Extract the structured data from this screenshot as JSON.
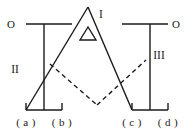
{
  "figure": {
    "type": "line-diagram",
    "width": 194,
    "height": 129,
    "background_color": "#ffffff",
    "stroke_color": "#1a1a1a"
  },
  "labels": {
    "origin_left": "O",
    "origin_right": "O",
    "region_one": "I",
    "region_two": "II",
    "region_three": "III",
    "delta_symbol": "Δ"
  },
  "axis_labels": {
    "a": "( a )",
    "b": "( b )",
    "c": "( c )",
    "d": "( d )"
  },
  "geometry": {
    "left_top_rule": {
      "x1": 26,
      "y1": 24,
      "x2": 72,
      "y2": 24
    },
    "right_top_rule": {
      "x1": 122,
      "y1": 24,
      "x2": 168,
      "y2": 24
    },
    "left_vertical": {
      "x1": 44,
      "y1": 24,
      "x2": 44,
      "y2": 110
    },
    "right_vertical": {
      "x1": 150,
      "y1": 24,
      "x2": 150,
      "y2": 110
    },
    "left_baseline": {
      "x1": 26,
      "y1": 110,
      "x2": 62,
      "y2": 110
    },
    "right_baseline": {
      "x1": 132,
      "y1": 110,
      "x2": 168,
      "y2": 110
    },
    "left_tick_outer": {
      "x1": 26,
      "y1": 104,
      "x2": 26,
      "y2": 110
    },
    "left_tick_inner": {
      "x1": 62,
      "y1": 104,
      "x2": 62,
      "y2": 110
    },
    "right_tick_inner": {
      "x1": 132,
      "y1": 104,
      "x2": 132,
      "y2": 110
    },
    "right_tick_outer": {
      "x1": 168,
      "y1": 104,
      "x2": 168,
      "y2": 110
    },
    "peak_left_edge": {
      "x1": 26,
      "y1": 110,
      "x2": 88,
      "y2": 7
    },
    "peak_right_edge": {
      "x1": 88,
      "y1": 7,
      "x2": 132,
      "y2": 110
    },
    "dashed_left": {
      "x1": 50,
      "y1": 64,
      "x2": 97,
      "y2": 105
    },
    "dashed_right": {
      "x1": 97,
      "y1": 105,
      "x2": 146,
      "y2": 60
    },
    "delta_triangle": {
      "apex_x": 88,
      "apex_y": 26,
      "left_x": 80,
      "left_y": 40,
      "right_x": 96,
      "right_y": 40
    }
  },
  "label_positions": {
    "origin_left": {
      "x": 11,
      "y": 28
    },
    "origin_right": {
      "x": 174,
      "y": 28
    },
    "region_one": {
      "x": 100,
      "y": 17
    },
    "region_two": {
      "x": 14,
      "y": 72
    },
    "region_three": {
      "x": 155,
      "y": 58
    },
    "delta_symbol": {
      "x": 84,
      "y": 39
    },
    "a": {
      "x": 14,
      "y": 125
    },
    "b": {
      "x": 50,
      "y": 125
    },
    "c": {
      "x": 120,
      "y": 125
    },
    "d": {
      "x": 156,
      "y": 125
    }
  }
}
